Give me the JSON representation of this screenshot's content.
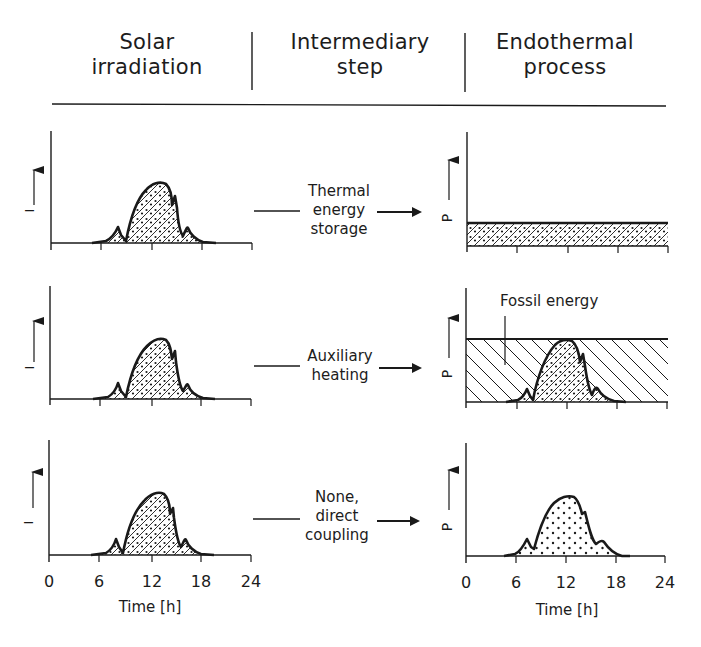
{
  "header": {
    "columns": [
      {
        "line1": "Solar",
        "line2": "irradiation"
      },
      {
        "line1": "Intermediary",
        "line2": "step"
      },
      {
        "line1": "Endothermal",
        "line2": "process"
      }
    ]
  },
  "rows": [
    {
      "left_ylabel": "I",
      "step": {
        "line1": "Thermal",
        "line2": "energy",
        "line3": "storage"
      },
      "right_ylabel": "P",
      "right_profile": "constant band (stored solar energy, hatched+dotted)"
    },
    {
      "left_ylabel": "I",
      "step": {
        "line1": "Auxiliary",
        "line2": "heating"
      },
      "right_ylabel": "P",
      "right_annotation": "Fossil energy",
      "right_profile": "constant band (fossil, hatched) overlaid with solar profile"
    },
    {
      "left_ylabel": "I",
      "step": {
        "line1": "None,",
        "line2": "direct",
        "line3": "coupling"
      },
      "right_ylabel": "P",
      "right_profile": "solar profile (dotted)"
    }
  ],
  "xaxis": {
    "ticks": [
      "0",
      "6",
      "12",
      "18",
      "24"
    ],
    "title": "Time [h]"
  },
  "legend": {
    "solar_fill": "diagonal hatch with dots",
    "fossil_fill": "back-diagonal hatch",
    "direct_fill": "dots"
  },
  "colors": {
    "ink": "#1a1a1a",
    "background": "#ffffff"
  }
}
